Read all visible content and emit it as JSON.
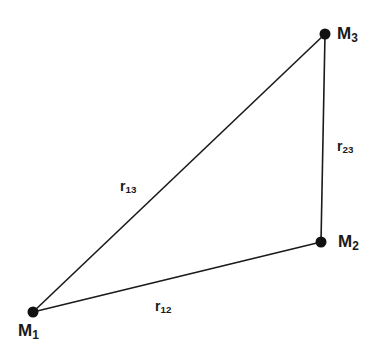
{
  "diagram": {
    "points": [
      {
        "id": "M1",
        "name": "M",
        "sub": "1",
        "x": 33,
        "y": 312
      },
      {
        "id": "M2",
        "name": "M",
        "sub": "2",
        "x": 321,
        "y": 242
      },
      {
        "id": "M3",
        "name": "M",
        "sub": "3",
        "x": 325,
        "y": 34
      }
    ],
    "edges": [
      {
        "from": "M1",
        "to": "M2",
        "name": "r",
        "sub": "12"
      },
      {
        "from": "M2",
        "to": "M3",
        "name": "r",
        "sub": "23"
      },
      {
        "from": "M1",
        "to": "M3",
        "name": "r",
        "sub": "13"
      }
    ],
    "line_color": "#1a1a1a"
  }
}
